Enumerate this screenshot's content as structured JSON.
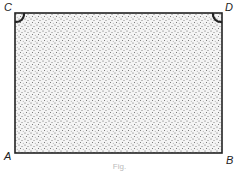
{
  "diagram": {
    "type": "rectangle with stippled fill and right-angle marks",
    "vertices": {
      "A": "bottom-left",
      "B": "bottom-right",
      "C": "top-left",
      "D": "top-right"
    },
    "labels": {
      "a": "A",
      "b": "B",
      "c": "C",
      "d": "D"
    },
    "right_angle_marks": [
      "C",
      "D"
    ],
    "caption": "Fig."
  }
}
